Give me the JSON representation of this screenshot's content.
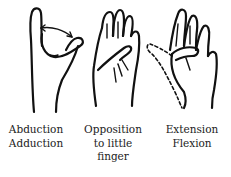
{
  "figure": {
    "panels": [
      {
        "id": "abduction-adduction",
        "caption_lines": [
          "Abduction",
          "Adduction"
        ],
        "depiction": "hand with thumb moving away/toward index finger, double-headed arrow"
      },
      {
        "id": "opposition",
        "caption_lines": [
          "Opposition",
          "to little",
          "finger"
        ],
        "depiction": "hand with thumb crossing palm to touch little finger"
      },
      {
        "id": "extension-flexion",
        "caption_lines": [
          "Extension",
          "Flexion"
        ],
        "depiction": "open palm with thumb flexed across palm; dashed outline shows extended thumb"
      }
    ],
    "colors": {
      "ink": "#111111",
      "background": "#ffffff"
    }
  }
}
